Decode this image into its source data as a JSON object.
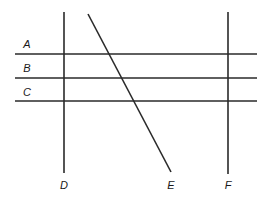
{
  "diagram": {
    "stroke_color": "#2a2a2a",
    "background": "#ffffff",
    "horizontal_lines": [
      {
        "label": "A",
        "y": 54,
        "x1": 15,
        "x2": 257,
        "label_x": 27,
        "label_y": 48
      },
      {
        "label": "B",
        "y": 78,
        "x1": 15,
        "x2": 257,
        "label_x": 27,
        "label_y": 72
      },
      {
        "label": "C",
        "y": 101,
        "x1": 15,
        "x2": 257,
        "label_x": 27,
        "label_y": 96
      }
    ],
    "other_lines": [
      {
        "label": "D",
        "x1": 64,
        "y1": 12,
        "x2": 64,
        "y2": 173,
        "label_x": 64,
        "label_y": 189,
        "orientation": "vertical"
      },
      {
        "label": "E",
        "x1": 88,
        "y1": 14,
        "x2": 171,
        "y2": 172,
        "label_x": 171,
        "label_y": 189,
        "orientation": "diagonal"
      },
      {
        "label": "F",
        "x1": 228,
        "y1": 12,
        "x2": 228,
        "y2": 174,
        "label_x": 228,
        "label_y": 189,
        "orientation": "vertical"
      }
    ]
  }
}
